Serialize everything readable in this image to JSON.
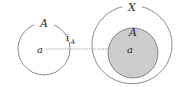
{
  "figure": {
    "kind": "math-diagram",
    "background_color": "#ffffff",
    "stroke_color": "#6f6f6f",
    "text_color": "#2b2b2b",
    "shade_color": "#cccccc",
    "arrow_color": "#9a9a9a"
  },
  "left_side": {
    "set_label": "A",
    "element_label": "a"
  },
  "right_side": {
    "outer_set_label": "X",
    "inner_set_label": "A",
    "element_label": "a"
  },
  "arrow": {
    "label_main": "i",
    "label_subscript": "A",
    "style": "dotted",
    "head": "arrowhead-right"
  }
}
